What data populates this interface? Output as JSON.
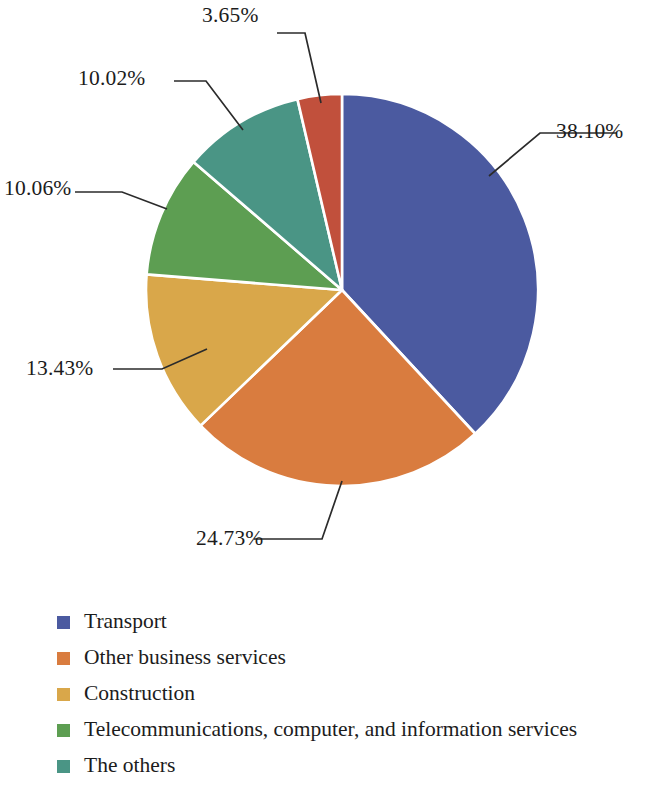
{
  "chart_data": {
    "type": "pie",
    "title": "",
    "subtitle": "",
    "xlabel": "",
    "ylabel": "",
    "grid": false,
    "legend_position": "bottom-left",
    "units": "percent",
    "start_angle_deg": 0,
    "direction": "clockwise",
    "categories": [
      "Transport",
      "Other business services",
      "Construction",
      "Telecommunications, computer, and information services",
      "The others",
      "Unlabeled slice"
    ],
    "values": [
      38.1,
      24.73,
      13.43,
      10.06,
      10.02,
      3.65
    ],
    "data_labels": [
      "38.10%",
      "24.73%",
      "13.43%",
      "10.06%",
      "10.02%",
      "3.65%"
    ],
    "colors": [
      "#4b5aa0",
      "#d97c3f",
      "#d9a74a",
      "#5d9e52",
      "#4a9585",
      "#c1503c"
    ],
    "slices": [
      {
        "label": "38.10%",
        "value": 38.1,
        "color": "#4b5aa0",
        "category": "Transport"
      },
      {
        "label": "24.73%",
        "value": 24.73,
        "color": "#d97c3f",
        "category": "Other business services"
      },
      {
        "label": "13.43%",
        "value": 13.43,
        "color": "#d9a74a",
        "category": "Construction"
      },
      {
        "label": "10.06%",
        "value": 10.06,
        "color": "#5d9e52",
        "category": "Telecommunications, computer, and information services"
      },
      {
        "label": "10.02%",
        "value": 10.02,
        "color": "#4a9585",
        "category": "The others"
      },
      {
        "label": "3.65%",
        "value": 3.65,
        "color": "#c1503c",
        "category": ""
      }
    ]
  },
  "legend": {
    "items": [
      {
        "label": "Transport",
        "color": "#4b5aa0"
      },
      {
        "label": "Other business services",
        "color": "#d97c3f"
      },
      {
        "label": "Construction",
        "color": "#d9a74a"
      },
      {
        "label": "Telecommunications, computer, and information services",
        "color": "#5d9e52"
      },
      {
        "label": "The others",
        "color": "#4a9585"
      }
    ]
  },
  "style": {
    "background": "#ffffff",
    "leader_line_color": "#2b2b2b",
    "slice_border_color": "#ffffff",
    "text_color": "#1c1c1c"
  }
}
